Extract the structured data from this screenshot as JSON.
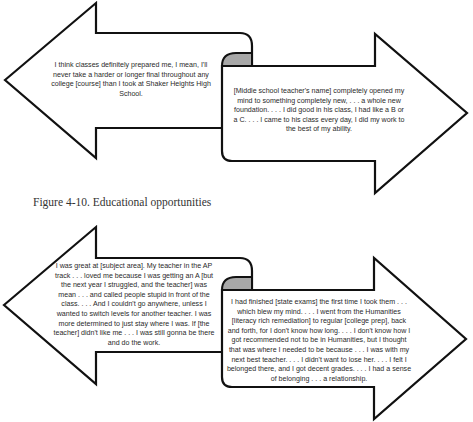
{
  "figure_top": {
    "left_arrow": {
      "direction": "left",
      "quote": "I think classes definitely prepared me, I mean, I'll never take a harder or longer final throughout any college [course] than I took at Shaker Heights High School."
    },
    "right_arrow": {
      "direction": "right",
      "quote": "[Middle school teacher's name] completely opened my mind to something completely new, . . . a whole new foundation. . . . I did good in his class, I had like a B or a C. . . . I came to his class every day, I did my work to the best of my ability."
    }
  },
  "caption": "Figure 4-10. Educational opportunities",
  "figure_bottom": {
    "left_arrow": {
      "direction": "left",
      "quote": "I was great at [subject area]. My teacher in the AP track . . . loved me because I was getting an A [but the next year I struggled, and the teacher] was mean . . . and called people stupid in front of the class. . . . And I couldn't go anywhere, unless I wanted to switch levels for another teacher. I was more determined to just stay where I was. If [the teacher] didn't like me . . . I was still gonna be there and do the work."
    },
    "right_arrow": {
      "direction": "right",
      "quote": "I had finished [state exams] the first time I took them . . . which blew my mind. . . . I went from the Humanities [literacy rich remediation] to regular [college prep], back and forth, for I don't know how long. . . . I don't know how I got recommended not to be in Humanities, but I thought that was where I needed to be because . . . I was with my next best teacher. . . . I didn't want to lose her. . . . I felt I belonged there, and I got decent grades. . . . I had a sense of belonging . . . a relationship."
    }
  },
  "colors": {
    "outline": "#111111",
    "fill": "#ffffff",
    "curl_shade": "#a8a8a8"
  }
}
